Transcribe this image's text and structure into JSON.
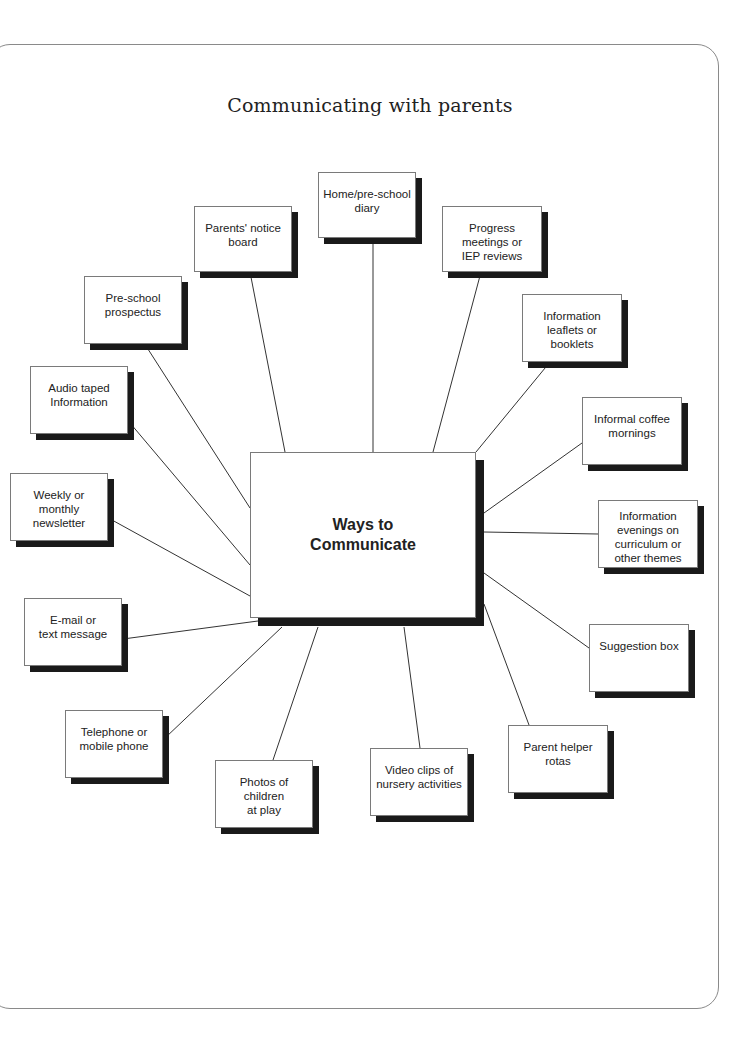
{
  "title": "Communicating with parents",
  "center": {
    "label_line1": "Ways to",
    "label_line2": "Communicate"
  },
  "nodes": [
    {
      "id": "home-diary",
      "lines": [
        "Home/pre-school",
        "diary"
      ]
    },
    {
      "id": "notice-board",
      "lines": [
        "Parents' notice",
        "board"
      ]
    },
    {
      "id": "progress-meetings",
      "lines": [
        "Progress",
        "meetings or",
        "IEP reviews"
      ]
    },
    {
      "id": "prospectus",
      "lines": [
        "Pre-school",
        "prospectus"
      ]
    },
    {
      "id": "leaflets",
      "lines": [
        "Information",
        "leaflets or",
        "booklets"
      ]
    },
    {
      "id": "audio",
      "lines": [
        "Audio taped",
        "Information"
      ]
    },
    {
      "id": "coffee-mornings",
      "lines": [
        "Informal coffee",
        "mornings"
      ]
    },
    {
      "id": "newsletter",
      "lines": [
        "Weekly or monthly",
        "newsletter"
      ]
    },
    {
      "id": "info-evenings",
      "lines": [
        "Information",
        "evenings on",
        "curriculum or",
        "other themes"
      ]
    },
    {
      "id": "email",
      "lines": [
        "E-mail or",
        "text message"
      ]
    },
    {
      "id": "suggestion-box",
      "lines": [
        "Suggestion box"
      ]
    },
    {
      "id": "telephone",
      "lines": [
        "Telephone or",
        "mobile phone"
      ]
    },
    {
      "id": "parent-helper",
      "lines": [
        "Parent helper",
        "rotas"
      ]
    },
    {
      "id": "photos",
      "lines": [
        "Photos of children",
        "at play"
      ]
    },
    {
      "id": "video-clips",
      "lines": [
        "Video clips of",
        "nursery activities"
      ]
    }
  ]
}
